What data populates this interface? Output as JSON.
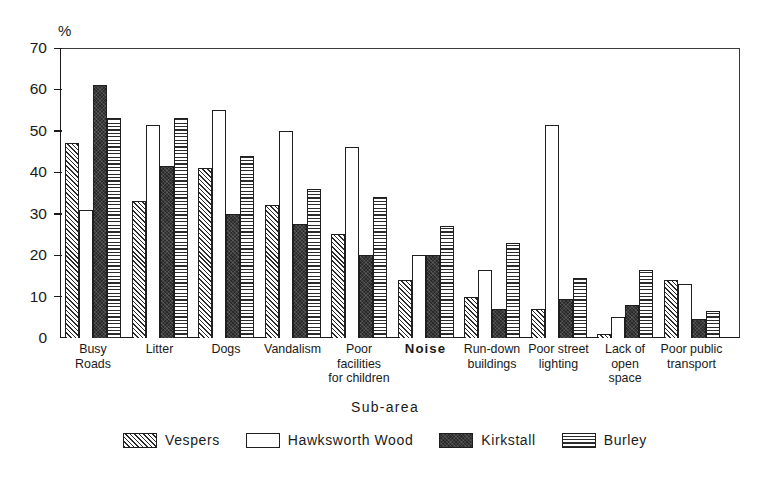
{
  "chart_data": {
    "type": "bar",
    "title": "",
    "xlabel": "Sub-area",
    "ylabel": "%",
    "ylim": [
      0,
      70
    ],
    "yticks": [
      0,
      10,
      20,
      30,
      40,
      50,
      60,
      70
    ],
    "grid": false,
    "legend_position": "bottom",
    "categories": [
      "Busy\nRoads",
      "Litter",
      "Dogs",
      "Vandalism",
      "Poor\nfacilities\nfor children",
      "Noise",
      "Run-down\nbuildings",
      "Poor street\nlighting",
      "Lack of\nopen\nspace",
      "Poor public\ntransport"
    ],
    "series": [
      {
        "name": "Vespers",
        "pattern": "diagonal-hatch",
        "values": [
          47,
          33,
          41,
          32,
          25,
          14,
          10,
          7,
          1,
          14
        ]
      },
      {
        "name": "Hawksworth Wood",
        "pattern": "white-fill",
        "values": [
          31,
          51.5,
          55,
          50,
          46,
          20,
          16.5,
          51.5,
          5,
          13
        ]
      },
      {
        "name": "Kirkstall",
        "pattern": "solid-dark",
        "values": [
          61,
          41.5,
          30,
          27.5,
          20,
          20,
          7,
          9.5,
          8,
          4.5
        ]
      },
      {
        "name": "Burley",
        "pattern": "horizontal-lines",
        "values": [
          53,
          53,
          44,
          36,
          34,
          27,
          23,
          14.5,
          16.5,
          6.5
        ]
      }
    ]
  },
  "axis": {
    "y_unit_label": "%",
    "x_title": "Sub-area",
    "tick_labels": [
      "70",
      "60",
      "50",
      "40",
      "30",
      "20",
      "10",
      "0"
    ]
  },
  "legend": {
    "items": [
      {
        "label": "Vespers",
        "swatch": "diagonal-hatch-swatch"
      },
      {
        "label": "Hawksworth Wood",
        "swatch": "white-fill-swatch"
      },
      {
        "label": "Kirkstall",
        "swatch": "solid-dark-swatch"
      },
      {
        "label": "Burley",
        "swatch": "horizontal-lines-swatch"
      }
    ]
  },
  "colors": {
    "ink": "#1a1a1a",
    "background": "#ffffff",
    "bar_outline": "#1f1f1f",
    "kirkstall_fill": "#2a2a2a"
  }
}
